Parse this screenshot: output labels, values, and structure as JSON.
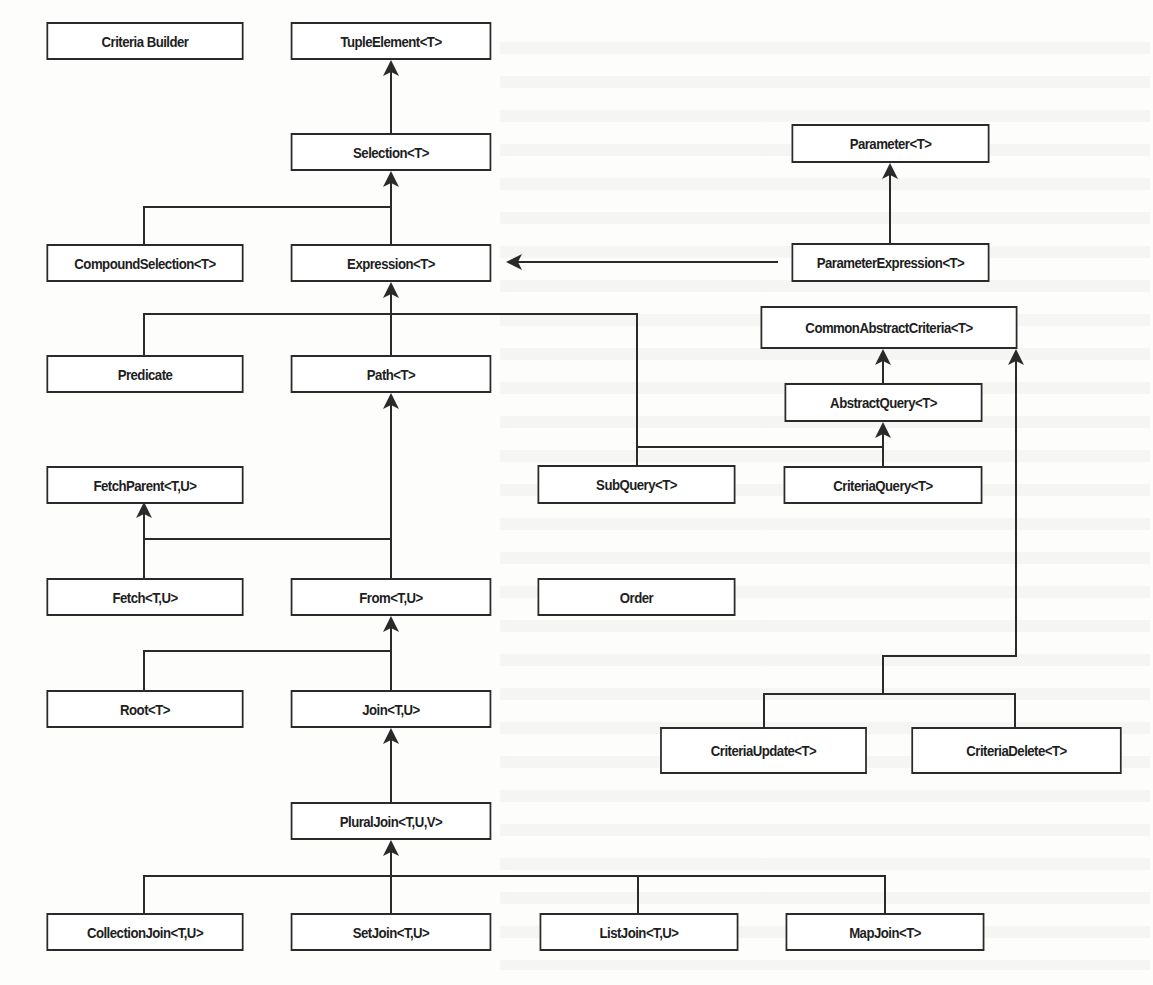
{
  "diagram": {
    "type": "class-hierarchy",
    "colors": {
      "line": "#2a2a2a",
      "box_border": "#2a2a2a",
      "box_fill": "#ffffff",
      "text": "#1e1e1e",
      "background": "#fdfdfc"
    },
    "nodes": {
      "criteria_builder": "Criteria Builder",
      "tuple_element": "TupleElement<T>",
      "selection": "Selection<T>",
      "parameter": "Parameter<T>",
      "compound_selection": "CompoundSelection<T>",
      "expression": "Expression<T>",
      "parameter_expression": "ParameterExpression<T>",
      "common_abstract_criteria": "CommonAbstractCriteria<T>",
      "predicate": "Predicate",
      "path": "Path<T>",
      "abstract_query": "AbstractQuery<T>",
      "fetch_parent": "FetchParent<T,U>",
      "subquery": "SubQuery<T>",
      "criteria_query": "CriteriaQuery<T>",
      "fetch": "Fetch<T,U>",
      "from": "From<T,U>",
      "order": "Order",
      "root": "Root<T>",
      "join": "Join<T,U>",
      "criteria_update": "CriteriaUpdate<T>",
      "criteria_delete": "CriteriaDelete<T>",
      "plural_join": "PluralJoin<T,U,V>",
      "collection_join": "CollectionJoin<T,U>",
      "set_join": "SetJoin<T,U>",
      "list_join": "ListJoin<T,U>",
      "map_join": "MapJoin<T>"
    },
    "edges": [
      {
        "from": "Selection<T>",
        "to": "TupleElement<T>"
      },
      {
        "from": "CompoundSelection<T>",
        "to": "Selection<T>"
      },
      {
        "from": "Expression<T>",
        "to": "Selection<T>"
      },
      {
        "from": "ParameterExpression<T>",
        "to": "Parameter<T>"
      },
      {
        "from": "ParameterExpression<T>",
        "to": "Expression<T>"
      },
      {
        "from": "Predicate",
        "to": "Expression<T>"
      },
      {
        "from": "Path<T>",
        "to": "Expression<T>"
      },
      {
        "from": "SubQuery<T>",
        "to": "Expression<T>"
      },
      {
        "from": "AbstractQuery<T>",
        "to": "CommonAbstractCriteria<T>"
      },
      {
        "from": "SubQuery<T>",
        "to": "AbstractQuery<T>"
      },
      {
        "from": "CriteriaQuery<T>",
        "to": "AbstractQuery<T>"
      },
      {
        "from": "Fetch<T,U>",
        "to": "FetchParent<T,U>"
      },
      {
        "from": "From<T,U>",
        "to": "FetchParent<T,U>"
      },
      {
        "from": "From<T,U>",
        "to": "Path<T>"
      },
      {
        "from": "Root<T>",
        "to": "From<T,U>"
      },
      {
        "from": "Join<T,U>",
        "to": "From<T,U>"
      },
      {
        "from": "PluralJoin<T,U,V>",
        "to": "Join<T,U>"
      },
      {
        "from": "CollectionJoin<T,U>",
        "to": "PluralJoin<T,U,V>"
      },
      {
        "from": "SetJoin<T,U>",
        "to": "PluralJoin<T,U,V>"
      },
      {
        "from": "ListJoin<T,U>",
        "to": "PluralJoin<T,U,V>"
      },
      {
        "from": "MapJoin<T>",
        "to": "PluralJoin<T,U,V>"
      },
      {
        "from": "CriteriaUpdate<T>",
        "to": "CommonAbstractCriteria<T>"
      },
      {
        "from": "CriteriaDelete<T>",
        "to": "CommonAbstractCriteria<T>"
      }
    ]
  }
}
